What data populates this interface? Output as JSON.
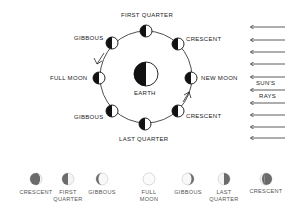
{
  "diagram": {
    "orbit_phases": [
      {
        "id": "first-quarter",
        "label": "FIRST QUARTER"
      },
      {
        "id": "crescent-top",
        "label": "CRESCENT"
      },
      {
        "id": "new-moon",
        "label": "NEW MOON"
      },
      {
        "id": "crescent-bottom",
        "label": "CRESCENT"
      },
      {
        "id": "last-quarter",
        "label": "LAST QUARTER"
      },
      {
        "id": "gibbous-bottom",
        "label": "GIBBOUS"
      },
      {
        "id": "full-moon",
        "label": "FULL MOON"
      },
      {
        "id": "gibbous-top",
        "label": "GIBBOUS"
      }
    ],
    "earth_label": "EARTH",
    "sun_rays": {
      "label_line1": "SUN'S",
      "label_line2": "RAYS",
      "arrow_count": 10
    },
    "appearance_row": [
      {
        "label_line1": "CRESCENT",
        "label_line2": ""
      },
      {
        "label_line1": "FIRST",
        "label_line2": "QUARTER"
      },
      {
        "label_line1": "GIBBOUS",
        "label_line2": ""
      },
      {
        "label_line1": "FULL",
        "label_line2": "MOON"
      },
      {
        "label_line1": "GIBBOUS",
        "label_line2": ""
      },
      {
        "label_line1": "LAST",
        "label_line2": "QUARTER"
      },
      {
        "label_line1": "CRESCENT",
        "label_line2": ""
      }
    ],
    "colors": {
      "ink": "#111111",
      "shade": "#6b6b6b",
      "outline": "#bdbdbd",
      "background": "#ffffff"
    }
  }
}
